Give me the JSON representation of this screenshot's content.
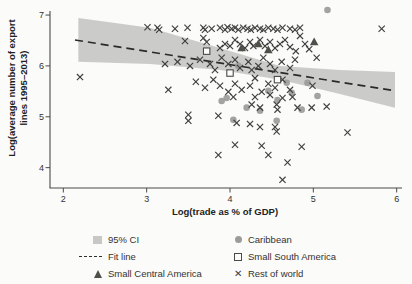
{
  "figure": {
    "ylabel_line1": "Log(average number of export",
    "ylabel_line2": "lines 1995–2013)",
    "xlabel": "Log(trade as % of GDP)"
  },
  "icons": {
    "x_marker": "✕"
  },
  "colors": {
    "background": "#fbfbf9",
    "axis": "#4a4a4a",
    "tick_text": "#333333",
    "ci_band": "#c8c8c6",
    "fit_line": "#2a2a2a",
    "rest_of_world": "#3f3f3f",
    "caribbean": "#9b9b99",
    "small_central_america": "#4f4f49",
    "small_south_america": "#4a4a4a"
  },
  "legend": {
    "col1": [
      {
        "label": "95% CI",
        "marker": "band"
      },
      {
        "label": "Fit line",
        "marker": "dash"
      },
      {
        "label": "Small Central America",
        "marker": "triangle"
      }
    ],
    "col2": [
      {
        "label": "Caribbean",
        "marker": "circle"
      },
      {
        "label": "Small South America",
        "marker": "open-square"
      },
      {
        "label": "Rest of world",
        "marker": "x"
      }
    ]
  },
  "chart_data": {
    "type": "scatter",
    "title": "",
    "xlabel": "Log(trade as % of GDP)",
    "ylabel": "Log(average number of export lines 1995–2013)",
    "xlim": [
      1.84,
      6.04
    ],
    "ylim": [
      3.6,
      7.06
    ],
    "xticks": [
      2,
      3,
      4,
      5,
      6
    ],
    "yticks": [
      4,
      5,
      6,
      7
    ],
    "grid": false,
    "legend_position": "bottom",
    "fit_line": {
      "x": [
        2.14,
        5.98
      ],
      "y": [
        6.51,
        5.51
      ]
    },
    "ci_band": {
      "x": [
        2.18,
        3.04,
        3.88,
        4.6,
        5.32,
        5.98
      ],
      "y_top": [
        6.94,
        6.75,
        6.35,
        6.0,
        5.92,
        5.88
      ],
      "y_bottom": [
        6.08,
        6.04,
        5.92,
        5.73,
        5.45,
        5.18
      ]
    },
    "series": [
      {
        "name": "Caribbean",
        "marker": "circle",
        "color": "#9b9b99",
        "points": [
          [
            3.9,
            5.31
          ],
          [
            3.96,
            5.37
          ],
          [
            4.04,
            4.94
          ],
          [
            4.1,
            6.0
          ],
          [
            4.2,
            5.18
          ],
          [
            4.36,
            5.12
          ],
          [
            4.46,
            5.51
          ],
          [
            4.56,
            4.92
          ],
          [
            4.57,
            5.33
          ],
          [
            4.68,
            5.67
          ],
          [
            4.74,
            5.47
          ],
          [
            4.86,
            5.14
          ],
          [
            4.93,
            5.67
          ],
          [
            5.05,
            5.41
          ],
          [
            5.17,
            7.1
          ]
        ]
      },
      {
        "name": "Rest of world",
        "marker": "x",
        "color": "#3f3f3f",
        "points": [
          [
            3.01,
            6.76
          ],
          [
            3.13,
            6.75
          ],
          [
            3.15,
            6.71
          ],
          [
            3.34,
            6.73
          ],
          [
            3.49,
            6.75
          ],
          [
            3.68,
            6.75
          ],
          [
            3.7,
            6.71
          ],
          [
            3.78,
            6.73
          ],
          [
            3.88,
            6.75
          ],
          [
            3.94,
            6.71
          ],
          [
            3.97,
            6.76
          ],
          [
            4.02,
            6.73
          ],
          [
            4.06,
            6.75
          ],
          [
            4.1,
            6.71
          ],
          [
            4.16,
            6.75
          ],
          [
            4.21,
            6.73
          ],
          [
            4.25,
            6.71
          ],
          [
            4.3,
            6.75
          ],
          [
            4.36,
            6.73
          ],
          [
            4.4,
            6.71
          ],
          [
            4.46,
            6.75
          ],
          [
            4.52,
            6.73
          ],
          [
            4.57,
            6.71
          ],
          [
            4.63,
            6.75
          ],
          [
            4.72,
            6.73
          ],
          [
            4.78,
            6.71
          ],
          [
            4.84,
            6.75
          ],
          [
            5.82,
            6.73
          ],
          [
            3.46,
            6.49
          ],
          [
            3.68,
            6.55
          ],
          [
            3.72,
            6.47
          ],
          [
            3.88,
            6.35
          ],
          [
            3.94,
            6.43
          ],
          [
            4.0,
            6.39
          ],
          [
            4.06,
            6.51
          ],
          [
            4.12,
            6.43
          ],
          [
            4.18,
            6.35
          ],
          [
            4.24,
            6.47
          ],
          [
            4.28,
            6.39
          ],
          [
            4.36,
            6.51
          ],
          [
            4.42,
            6.39
          ],
          [
            4.48,
            6.47
          ],
          [
            4.54,
            6.35
          ],
          [
            4.6,
            6.43
          ],
          [
            4.66,
            6.51
          ],
          [
            4.72,
            6.37
          ],
          [
            4.79,
            6.29
          ],
          [
            4.84,
            6.59
          ],
          [
            4.9,
            6.43
          ],
          [
            4.95,
            6.33
          ],
          [
            3.22,
            6.04
          ],
          [
            3.37,
            6.08
          ],
          [
            3.52,
            6.0
          ],
          [
            3.64,
            6.12
          ],
          [
            3.76,
            6.04
          ],
          [
            3.82,
            5.92
          ],
          [
            3.9,
            6.16
          ],
          [
            3.98,
            6.04
          ],
          [
            4.06,
            6.12
          ],
          [
            4.12,
            5.96
          ],
          [
            4.22,
            6.08
          ],
          [
            4.26,
            5.92
          ],
          [
            4.34,
            6.0
          ],
          [
            4.4,
            6.16
          ],
          [
            4.48,
            6.04
          ],
          [
            4.54,
            5.92
          ],
          [
            4.62,
            6.08
          ],
          [
            4.72,
            5.96
          ],
          [
            4.78,
            6.12
          ],
          [
            5.04,
            6.16
          ],
          [
            2.2,
            5.78
          ],
          [
            3.26,
            5.53
          ],
          [
            3.59,
            5.69
          ],
          [
            3.7,
            5.57
          ],
          [
            3.8,
            5.73
          ],
          [
            3.88,
            5.61
          ],
          [
            3.98,
            5.49
          ],
          [
            4.06,
            5.65
          ],
          [
            4.14,
            5.53
          ],
          [
            4.24,
            5.61
          ],
          [
            4.3,
            5.76
          ],
          [
            4.38,
            5.49
          ],
          [
            4.46,
            5.65
          ],
          [
            4.54,
            5.57
          ],
          [
            4.63,
            5.73
          ],
          [
            4.72,
            5.53
          ],
          [
            4.99,
            5.61
          ],
          [
            4.04,
            5.39
          ],
          [
            4.3,
            5.39
          ],
          [
            4.48,
            5.43
          ],
          [
            4.63,
            5.37
          ],
          [
            4.75,
            5.39
          ],
          [
            4.26,
            5.24
          ],
          [
            4.36,
            5.18
          ],
          [
            4.56,
            5.24
          ],
          [
            4.57,
            5.14
          ],
          [
            4.81,
            5.18
          ],
          [
            4.98,
            5.18
          ],
          [
            5.16,
            5.2
          ],
          [
            3.5,
            5.04
          ],
          [
            3.5,
            4.92
          ],
          [
            3.86,
            5.02
          ],
          [
            4.08,
            4.88
          ],
          [
            4.24,
            4.86
          ],
          [
            4.36,
            4.8
          ],
          [
            4.54,
            4.8
          ],
          [
            4.56,
            4.71
          ],
          [
            5.41,
            4.69
          ],
          [
            4.06,
            4.45
          ],
          [
            4.38,
            4.43
          ],
          [
            4.86,
            4.41
          ],
          [
            4.46,
            4.25
          ],
          [
            3.86,
            4.25
          ],
          [
            4.69,
            4.1
          ],
          [
            4.63,
            3.76
          ]
        ]
      },
      {
        "name": "Small Central America",
        "marker": "triangle",
        "color": "#4f4f49",
        "points": [
          [
            4.14,
            6.35
          ],
          [
            4.34,
            6.43
          ],
          [
            4.46,
            6.31
          ],
          [
            5.01,
            6.47
          ]
        ]
      },
      {
        "name": "Small South America",
        "marker": "open-square",
        "color": "#4a4a4a",
        "points": [
          [
            3.72,
            6.29
          ],
          [
            4.0,
            5.86
          ],
          [
            4.57,
            5.73
          ]
        ]
      }
    ]
  }
}
